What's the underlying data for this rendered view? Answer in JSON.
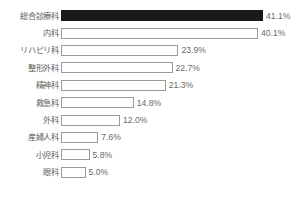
{
  "chart": {
    "footnote_text": ""
  },
  "chart_data": {
    "type": "bar",
    "orientation": "horizontal",
    "title": "",
    "subtitle": "",
    "xlabel": "",
    "ylabel": "",
    "xlim": [
      0,
      41.1
    ],
    "grid": false,
    "legend": false,
    "value_suffix": "%",
    "highlight_index": 0,
    "colors": {
      "highlight_bar": "#1b1b1b",
      "bar_fill": "#ffffff",
      "bar_border": "#9a9a9a",
      "label_text": "#5d5d5d",
      "value_text": "#6a6a6a",
      "background": "#ffffff"
    },
    "categories": [
      "総合診療科",
      "内科",
      "リハビリ科",
      "整形外科",
      "精神科",
      "救急科",
      "外科",
      "産婦人科",
      "小児科",
      "眼科"
    ],
    "values": [
      41.1,
      40.1,
      23.9,
      22.7,
      21.3,
      14.8,
      12.0,
      7.6,
      5.8,
      5.0
    ],
    "value_labels": [
      "41.1%",
      "40.1%",
      "23.9%",
      "22.7%",
      "21.3%",
      "14.8%",
      "12.0%",
      "7.6%",
      "5.8%",
      "5.0%"
    ],
    "rows": [
      {
        "category": "総合診療科",
        "value": 41.1,
        "label": "41.1%",
        "highlight": true
      },
      {
        "category": "内科",
        "value": 40.1,
        "label": "40.1%",
        "highlight": false
      },
      {
        "category": "リハビリ科",
        "value": 23.9,
        "label": "23.9%",
        "highlight": false
      },
      {
        "category": "整形外科",
        "value": 22.7,
        "label": "22.7%",
        "highlight": false
      },
      {
        "category": "精神科",
        "value": 21.3,
        "label": "21.3%",
        "highlight": false
      },
      {
        "category": "救急科",
        "value": 14.8,
        "label": "14.8%",
        "highlight": false
      },
      {
        "category": "外科",
        "value": 12.0,
        "label": "12.0%",
        "highlight": false
      },
      {
        "category": "産婦人科",
        "value": 7.6,
        "label": "7.6%",
        "highlight": false
      },
      {
        "category": "小児科",
        "value": 5.8,
        "label": "5.8%",
        "highlight": false
      },
      {
        "category": "眼科",
        "value": 5.0,
        "label": "5.0%",
        "highlight": false
      }
    ]
  }
}
